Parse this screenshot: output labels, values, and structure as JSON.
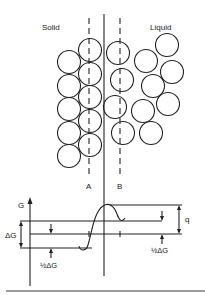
{
  "diagram": {
    "labels": {
      "solid": "Solid",
      "liquid": "Liquid",
      "plane_a": "A",
      "plane_b": "B",
      "axis_g": "G",
      "delta_g": "ΔG",
      "half_delta_g_left": "½ΔG",
      "half_delta_g_right": "½ΔG",
      "q": "q"
    },
    "colors": {
      "stroke": "#222222",
      "background": "#ffffff"
    },
    "solid_atoms": [
      {
        "cx": 90,
        "cy": 50
      },
      {
        "cx": 90,
        "cy": 74
      },
      {
        "cx": 90,
        "cy": 97
      },
      {
        "cx": 90,
        "cy": 121
      },
      {
        "cx": 90,
        "cy": 145
      },
      {
        "cx": 69,
        "cy": 62
      },
      {
        "cx": 69,
        "cy": 86
      },
      {
        "cx": 69,
        "cy": 109
      },
      {
        "cx": 69,
        "cy": 133
      },
      {
        "cx": 69,
        "cy": 156
      }
    ],
    "liquid_atoms": [
      {
        "cx": 118,
        "cy": 53
      },
      {
        "cx": 122,
        "cy": 80
      },
      {
        "cx": 115,
        "cy": 107
      },
      {
        "cx": 123,
        "cy": 133
      },
      {
        "cx": 146,
        "cy": 61
      },
      {
        "cx": 153,
        "cy": 86
      },
      {
        "cx": 143,
        "cy": 111
      },
      {
        "cx": 151,
        "cy": 133
      },
      {
        "cx": 167,
        "cy": 45
      },
      {
        "cx": 172,
        "cy": 72
      },
      {
        "cx": 168,
        "cy": 104
      }
    ],
    "atom_radius": 11.5
  }
}
